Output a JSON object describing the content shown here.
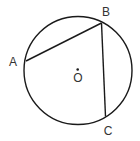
{
  "diagram": {
    "type": "circle-with-inscribed-chords",
    "colors": {
      "stroke": "#1a1a1a",
      "label": "#333333",
      "background": "#ffffff"
    },
    "circle": {
      "center_label": "O",
      "cx": 78,
      "cy": 70.5,
      "r": 54
    },
    "points": [
      {
        "id": "A",
        "label": "A",
        "x": 26,
        "y": 61,
        "label_x": 13,
        "label_y": 66
      },
      {
        "id": "B",
        "label": "B",
        "x": 101.5,
        "y": 23,
        "label_x": 106,
        "label_y": 16
      },
      {
        "id": "C",
        "label": "C",
        "x": 105.5,
        "y": 116.5,
        "label_x": 108,
        "label_y": 135
      }
    ],
    "center": {
      "label": "O",
      "dot_x": 77.7,
      "dot_y": 69.5,
      "label_x": 78,
      "label_y": 82
    },
    "segments": [
      {
        "from": "A",
        "to": "B",
        "name": "chord-AB"
      },
      {
        "from": "B",
        "to": "C",
        "name": "chord-BC"
      }
    ]
  }
}
